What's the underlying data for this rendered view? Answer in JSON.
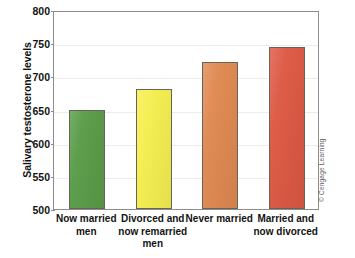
{
  "chart_data": {
    "type": "bar",
    "title": "",
    "xlabel": "",
    "ylabel": "Salivary testosterone levels",
    "categories": [
      "Now married men",
      "Divorced and now remarried men",
      "Never married",
      "Married and now divorced"
    ],
    "category_lines": [
      [
        "Now married",
        "men"
      ],
      [
        "Divorced and",
        "now remarried",
        "men"
      ],
      [
        "Never married"
      ],
      [
        "Married and",
        "now divorced"
      ]
    ],
    "values": [
      650,
      681,
      721,
      744
    ],
    "bar_colors": [
      "#5b9d4a",
      "#f5ef52",
      "#e08a53",
      "#dd5a45"
    ],
    "ylim": [
      500,
      800
    ],
    "yticks": [
      500,
      550,
      600,
      650,
      700,
      750,
      800
    ],
    "ytick_labels": [
      "500",
      "550",
      "600",
      "650",
      "700",
      "750",
      "800"
    ],
    "grid": true,
    "legend": "none"
  },
  "credit": {
    "text": "© Cengage Learning"
  }
}
